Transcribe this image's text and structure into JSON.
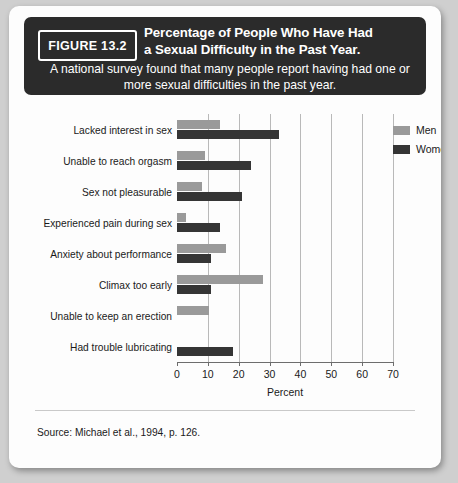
{
  "figure": {
    "tag": "FIGURE 13.2",
    "title_lines": [
      "Percentage of People Who Have Had",
      "a Sexual Difficulty in the Past Year."
    ],
    "subtitle": "A national survey found that many people report having had one or more sexual difficulties in the past year.",
    "source": "Source: Michael et al., 1994, p. 126."
  },
  "colors": {
    "header_background": "#2b2b2b",
    "page_background": "#fdfdfd",
    "men": "#9a9a9a",
    "women": "#353535",
    "gridline": "#b9b9b9",
    "axis": "#6d6d6d"
  },
  "legend": {
    "position": "top-right",
    "items": [
      {
        "label": "Men",
        "color": "#9a9a9a"
      },
      {
        "label": "Women",
        "color": "#353535"
      }
    ]
  },
  "chart_data": {
    "type": "bar",
    "orientation": "horizontal",
    "title": "Percentage of People Who Have Had a Sexual Difficulty in the Past Year.",
    "xlabel": "Percent",
    "ylabel": "",
    "xlim": [
      0,
      70
    ],
    "xticks": [
      0,
      10,
      20,
      30,
      40,
      50,
      60,
      70
    ],
    "grid": true,
    "categories": [
      "Lacked interest in sex",
      "Unable to reach orgasm",
      "Sex not pleasurable",
      "Experienced pain during sex",
      "Anxiety about performance",
      "Climax too early",
      "Unable to keep an erection",
      "Had trouble lubricating"
    ],
    "series": [
      {
        "name": "Men",
        "color": "#9a9a9a",
        "values": [
          14,
          9,
          8,
          3,
          16,
          28,
          10.5,
          null
        ]
      },
      {
        "name": "Women",
        "color": "#353535",
        "values": [
          33,
          24,
          21,
          14,
          11,
          11,
          null,
          18
        ]
      }
    ]
  }
}
